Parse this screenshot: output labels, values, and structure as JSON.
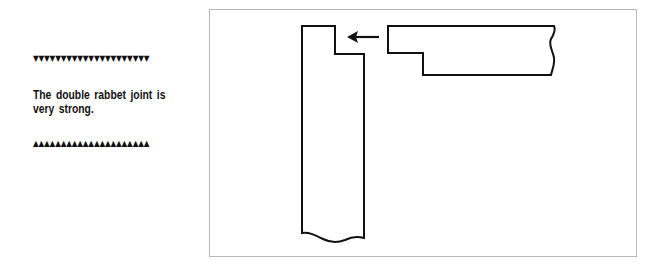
{
  "sidebar": {
    "top_rule": "▼▼▼▼▼▼▼▼▼▼▼▼▼▼▼▼▼▼▼▼▼",
    "caption": "The double rabbet joint is very strong.",
    "bottom_rule": "▲▲▲▲▲▲▲▲▲▲▲▲▲▲▲▲▲▲▲▲▲"
  },
  "figure": {
    "subject": "double rabbet joint",
    "stroke_color": "#111111",
    "border_color": "#b8b8b8",
    "parts": [
      {
        "name": "vertical-board",
        "description": "upright board with rabbet notch at top right"
      },
      {
        "name": "horizontal-board",
        "description": "horizontal board with rabbeted tongue at left end"
      },
      {
        "name": "assembly-arrow",
        "description": "arrow pointing left toward the notch"
      }
    ]
  }
}
